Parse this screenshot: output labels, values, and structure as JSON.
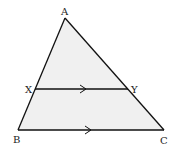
{
  "diagram": {
    "fill_color": "#f0f0f0",
    "stroke_color": "#111111",
    "vertices": {
      "A": {
        "label": "A",
        "x": 65,
        "y": 18
      },
      "B": {
        "label": "B",
        "x": 18,
        "y": 130
      },
      "C": {
        "label": "C",
        "x": 164,
        "y": 130
      },
      "X": {
        "label": "X",
        "x": 35,
        "y": 89
      },
      "Y": {
        "label": "Y",
        "x": 128,
        "y": 89
      }
    },
    "segments": [
      {
        "from": "A",
        "to": "B"
      },
      {
        "from": "A",
        "to": "C"
      },
      {
        "from": "B",
        "to": "C",
        "parallel_mark": true
      },
      {
        "from": "X",
        "to": "Y",
        "parallel_mark": true
      }
    ],
    "labels": {
      "A": "A",
      "B": "B",
      "C": "C",
      "X": "X",
      "Y": "Y"
    }
  }
}
